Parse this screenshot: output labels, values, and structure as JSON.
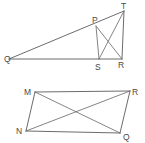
{
  "page": {
    "background_color": "#ffffff",
    "width": 145,
    "height": 143
  },
  "style": {
    "stroke_color": "#5a5a5a",
    "label_color": "#4a4a4a",
    "stroke_width": 0.9,
    "label_font_size": 8.5
  },
  "figures": [
    {
      "id": "figure-top",
      "name": "triangle-with-inscribed-quadrilateral",
      "shape_type": "triangle",
      "vertex_labels": [
        "Q",
        "P",
        "T",
        "S",
        "R"
      ],
      "points": {
        "Q": {
          "label": "Q",
          "x": 9,
          "y": 59,
          "label_x": 4,
          "label_y": 62
        },
        "P": {
          "label": "P",
          "x": 96,
          "y": 26,
          "label_x": 92,
          "label_y": 23
        },
        "T": {
          "label": "T",
          "x": 124,
          "y": 11,
          "label_x": 121,
          "label_y": 9
        },
        "S": {
          "label": "S",
          "x": 99,
          "y": 59,
          "label_x": 95,
          "label_y": 70
        },
        "R": {
          "label": "R",
          "x": 122,
          "y": 59,
          "label_x": 118,
          "label_y": 68
        }
      },
      "segments": [
        {
          "name": "segment-QT",
          "from": "Q",
          "to": "T"
        },
        {
          "name": "segment-QR",
          "from": "Q",
          "to": "R"
        },
        {
          "name": "segment-TR",
          "from": "T",
          "to": "R"
        },
        {
          "name": "segment-PS",
          "from": "P",
          "to": "S"
        },
        {
          "name": "segment-PR",
          "from": "P",
          "to": "R"
        },
        {
          "name": "segment-ST",
          "from": "S",
          "to": "T"
        }
      ]
    },
    {
      "id": "figure-bottom",
      "name": "parallelogram-with-diagonals",
      "shape_type": "parallelogram",
      "vertex_labels": [
        "M",
        "R",
        "Q",
        "N"
      ],
      "points": {
        "M": {
          "label": "M",
          "x": 35,
          "y": 92,
          "label_x": 24,
          "label_y": 95
        },
        "R": {
          "label": "R",
          "x": 130,
          "y": 91,
          "label_x": 132,
          "label_y": 95
        },
        "Q": {
          "label": "Q",
          "x": 120,
          "y": 133,
          "label_x": 123,
          "label_y": 140
        },
        "N": {
          "label": "N",
          "x": 26,
          "y": 131,
          "label_x": 16,
          "label_y": 134
        }
      },
      "segments": [
        {
          "name": "segment-MR",
          "from": "M",
          "to": "R"
        },
        {
          "name": "segment-RQ",
          "from": "R",
          "to": "Q"
        },
        {
          "name": "segment-QN",
          "from": "Q",
          "to": "N"
        },
        {
          "name": "segment-NM",
          "from": "N",
          "to": "M"
        },
        {
          "name": "diagonal-MQ",
          "from": "M",
          "to": "Q"
        },
        {
          "name": "diagonal-NR",
          "from": "N",
          "to": "R"
        }
      ]
    }
  ]
}
